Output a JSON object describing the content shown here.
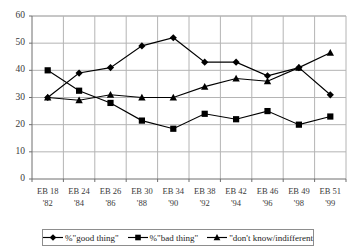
{
  "chart_data": {
    "type": "line",
    "title": "",
    "xlabel": "",
    "ylabel": "",
    "ylim": [
      0,
      60
    ],
    "ytick_step": 10,
    "grid": true,
    "legend_position": "bottom",
    "categories": [
      "EB 18",
      "EB 24",
      "EB 26",
      "EB 30",
      "EB 34",
      "EB 38",
      "EB 42",
      "EB 46",
      "EB 49",
      "EB 51"
    ],
    "subcategories": [
      "'82",
      "'84",
      "'86",
      "'88",
      "'90",
      "'92",
      "'94",
      "'96",
      "'98",
      "'99"
    ],
    "ytick_labels": [
      "0",
      "10",
      "20",
      "30",
      "40",
      "50",
      "60"
    ],
    "series": [
      {
        "name": "%\"good thing\"",
        "marker": "diamond",
        "color": "#000000",
        "values": [
          30,
          39,
          41,
          49,
          52,
          43,
          43,
          38,
          41,
          31
        ]
      },
      {
        "name": "%\"bad thing\"",
        "marker": "square",
        "color": "#000000",
        "values": [
          40,
          32.5,
          28,
          21.5,
          18.5,
          24,
          22,
          25,
          20,
          23
        ]
      },
      {
        "name": "\"don't know/indifferent",
        "marker": "triangle",
        "color": "#000000",
        "values": [
          30,
          29,
          31,
          30,
          30,
          34,
          37,
          36,
          41,
          46.5
        ]
      }
    ]
  },
  "legend": {
    "items": [
      {
        "label": "%\"good thing\"",
        "marker": "diamond"
      },
      {
        "label": "%\"bad thing\"",
        "marker": "square"
      },
      {
        "label": "\"don't know/indifferent",
        "marker": "triangle"
      }
    ]
  },
  "colors": {
    "series_line": "#000000",
    "gridline": "#b4b4b4",
    "axis": "#6f6f6f",
    "tick_text": "#3a3a3a",
    "legend_border": "#8d8d8d",
    "background": "#ffffff"
  }
}
